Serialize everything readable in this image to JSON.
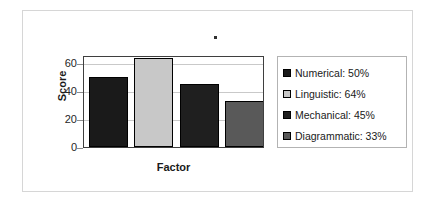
{
  "figure": {
    "border_color": "#d6d6d6",
    "background": "#ffffff",
    "artifact": "speck-dot"
  },
  "axes": {
    "y_title": "Score",
    "x_title": "Factor",
    "y_ticks": [
      "0",
      "20",
      "40",
      "60"
    ]
  },
  "legend": {
    "position": "right",
    "items": [
      {
        "label": "Numerical: 50%",
        "color": "#1a1a1a"
      },
      {
        "label": "Linguistic: 64%",
        "color": "#c8c8c8"
      },
      {
        "label": "Mechanical: 45%",
        "color": "#1f1f1f"
      },
      {
        "label": "Diagrammatic: 33%",
        "color": "#595959"
      }
    ]
  },
  "chart_data": {
    "type": "bar",
    "title": "",
    "xlabel": "Factor",
    "ylabel": "Score",
    "categories": [
      "Numerical",
      "Linguistic",
      "Mechanical",
      "Diagrammatic"
    ],
    "values": [
      50,
      64,
      45,
      33
    ],
    "value_labels": [
      "50%",
      "64%",
      "45%",
      "33%"
    ],
    "legend_entries": [
      "Numerical: 50%",
      "Linguistic: 64%",
      "Mechanical: 45%",
      "Diagrammatic: 33%"
    ],
    "bar_colors": [
      "#1a1a1a",
      "#c8c8c8",
      "#1f1f1f",
      "#595959"
    ],
    "ylim": [
      0,
      66
    ],
    "yticks": [
      0,
      20,
      40,
      60
    ],
    "ytick_labels": [
      "0",
      "20",
      "40",
      "60"
    ],
    "xtick_labels": [],
    "grid": true,
    "grid_axis": "y",
    "legend_position": "right",
    "plot_border": true
  }
}
